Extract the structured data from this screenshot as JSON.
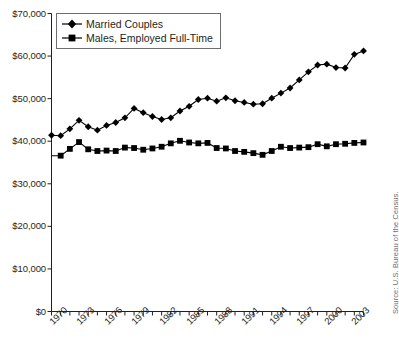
{
  "chart_data": {
    "type": "line",
    "title": "",
    "subtitle": "",
    "xlabel": "",
    "ylabel": "",
    "xlim": [
      1970,
      2004
    ],
    "ylim": [
      0,
      70000
    ],
    "grid": false,
    "legend_position": "top-left",
    "y_ticks": [
      0,
      10000,
      20000,
      30000,
      40000,
      50000,
      60000,
      70000
    ],
    "y_tick_labels": [
      "$0",
      "$10,000",
      "$20,000",
      "$30,000",
      "$40,000",
      "$50,000",
      "$60,000",
      "$70,000"
    ],
    "x": [
      1970,
      1971,
      1972,
      1973,
      1974,
      1975,
      1976,
      1977,
      1978,
      1979,
      1980,
      1981,
      1982,
      1983,
      1984,
      1985,
      1986,
      1987,
      1988,
      1989,
      1990,
      1991,
      1992,
      1993,
      1994,
      1995,
      1996,
      1997,
      1998,
      1999,
      2000,
      2001,
      2002,
      2003,
      2004
    ],
    "x_tick_labels": [
      "1970",
      "1973",
      "1976",
      "1979",
      "1982",
      "1985",
      "1988",
      "1991",
      "1994",
      "1997",
      "2000",
      "2003"
    ],
    "x_tick_years": [
      1970,
      1973,
      1976,
      1979,
      1982,
      1985,
      1988,
      1991,
      1994,
      1997,
      2000,
      2003
    ],
    "series": [
      {
        "name": "Married Couples",
        "marker": "diamond",
        "color": "#000000",
        "values": [
          41400,
          41300,
          42900,
          44900,
          43400,
          42600,
          43700,
          44400,
          45500,
          47700,
          46700,
          45800,
          45100,
          45500,
          47100,
          48200,
          49800,
          50100,
          49400,
          50200,
          49500,
          49100,
          48700,
          48800,
          50100,
          51300,
          52500,
          54400,
          56300,
          57900,
          58100,
          57300,
          57200,
          60400,
          61200
        ]
      },
      {
        "name": "Males, Employed Full-Time",
        "marker": "square",
        "color": "#000000",
        "values": [
          36600,
          36600,
          38200,
          39800,
          38100,
          37700,
          37800,
          37700,
          38500,
          38400,
          38000,
          38300,
          38700,
          39500,
          40100,
          39700,
          39500,
          39600,
          38400,
          38300,
          37700,
          37500,
          37200,
          36800,
          37700,
          38700,
          38400,
          38500,
          38600,
          39300,
          38800,
          39300,
          39400,
          39600,
          39700
        ]
      }
    ],
    "series_has_first_marker": [
      true,
      false
    ],
    "annotations": {
      "source": "Source: U.S. Bureau of the Census."
    }
  },
  "legend": {
    "items": [
      {
        "label": "Married Couples",
        "marker": "diamond-marker"
      },
      {
        "label": "Males, Employed Full-Time",
        "marker": "square-marker"
      }
    ]
  }
}
